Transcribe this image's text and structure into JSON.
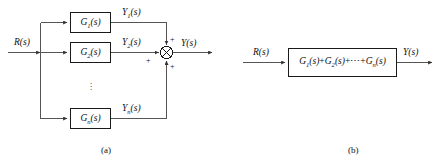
{
  "figure": {
    "panel_a": {
      "caption": "(a)",
      "input_label": "R(s)",
      "output_label": "Y(s)",
      "summing_junction": {
        "name": "summing-junction",
        "glyph": "⊗",
        "signs": [
          "+",
          "+",
          "+"
        ]
      },
      "ellipsis": "⋮",
      "blocks": [
        {
          "id": "g1",
          "base": "G",
          "sub": "1",
          "args": "(s)",
          "text": "G1(s)",
          "signal_base": "Y",
          "signal_sub": "1",
          "signal_args": "(s)",
          "signal_text": "Y1(s)"
        },
        {
          "id": "g2",
          "base": "G",
          "sub": "2",
          "args": "(s)",
          "text": "G2(s)",
          "signal_base": "Y",
          "signal_sub": "2",
          "signal_args": "(s)",
          "signal_text": "Y2(s)"
        },
        {
          "id": "gn",
          "base": "G",
          "sub": "n",
          "args": "(s)",
          "text": "Gn(s)",
          "signal_base": "Y",
          "signal_sub": "n",
          "signal_args": "(s)",
          "signal_text": "Yn(s)"
        }
      ]
    },
    "panel_b": {
      "caption": "(b)",
      "input_label": "R(s)",
      "output_label": "Y(s)",
      "block": {
        "id": "gsum",
        "term1_base": "G",
        "term1_sub": "1",
        "term1_args": "(s)",
        "plus1": "+",
        "term2_base": "G",
        "term2_sub": "2",
        "term2_args": "(s)",
        "plus2": "+",
        "cdots": "⋯",
        "plus3": "+",
        "term3_base": "G",
        "term3_sub": "n",
        "term3_args": "(s)",
        "text": "G1(s)+G2(s)+⋯+Gn(s)"
      }
    }
  },
  "colors": {
    "line": "#555555",
    "block_border": "#1a1a1a",
    "text": "#111111",
    "background": "#ffffff"
  }
}
